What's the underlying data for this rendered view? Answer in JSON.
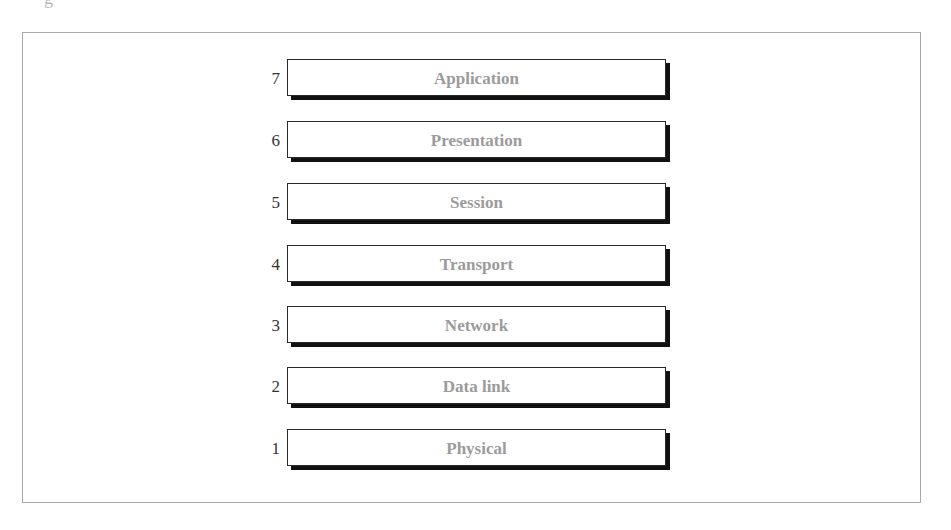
{
  "caption": {
    "fragment": "g"
  },
  "diagram": {
    "colors": {
      "label": "#9b9b9b",
      "number": "#333333",
      "shadow": "#111111",
      "frame": "#a8a8a8"
    },
    "layers": [
      {
        "number": "7",
        "label": "Application"
      },
      {
        "number": "6",
        "label": "Presentation"
      },
      {
        "number": "5",
        "label": "Session"
      },
      {
        "number": "4",
        "label": "Transport"
      },
      {
        "number": "3",
        "label": "Network"
      },
      {
        "number": "2",
        "label": "Data link"
      },
      {
        "number": "1",
        "label": "Physical"
      }
    ]
  }
}
